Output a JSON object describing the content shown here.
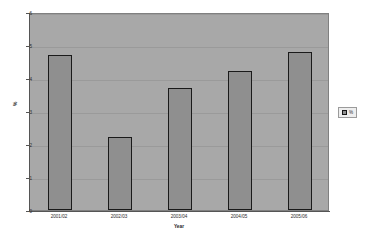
{
  "chart_data": {
    "type": "bar",
    "title": "",
    "xlabel": "Year",
    "ylabel": "%",
    "categories": [
      "2001/02",
      "2002/03",
      "2003/04",
      "2004/05",
      "2005/06"
    ],
    "values": [
      4.7,
      2.2,
      3.7,
      4.2,
      4.8
    ],
    "series": [
      {
        "name": "%",
        "values": [
          4.7,
          2.2,
          3.7,
          4.2,
          4.8
        ]
      }
    ],
    "ylim": [
      0,
      6
    ],
    "ytick_labels": [
      "0",
      "1",
      "2",
      "3",
      "4",
      "5",
      "6"
    ],
    "ytick_values": [
      0,
      1,
      2,
      3,
      4,
      5,
      6
    ],
    "grid": true,
    "legend": {
      "position": "right",
      "entries": [
        {
          "label": "%",
          "color": "#8f8f8f"
        }
      ]
    },
    "colors": {
      "plot_background": "#a8a8a8",
      "bar_fill": "#8f8f8f",
      "bar_border": "#1a1a1a",
      "gridline": "#9a9a9a",
      "axis": "#555555",
      "page_background": "#ffffff",
      "text": "#2b2b2b"
    }
  }
}
